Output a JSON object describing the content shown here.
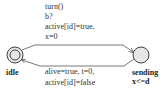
{
  "automaton": {
    "locations": [
      {
        "id": "idle",
        "name": "idle",
        "initial": true,
        "invariant": ""
      },
      {
        "id": "sending",
        "name": "sending",
        "initial": false,
        "invariant": "x<=d"
      }
    ],
    "edges": [
      {
        "from": "idle",
        "to": "sending",
        "labels": [
          "turn()",
          "b?",
          "active[id]=true,",
          "x=0"
        ]
      },
      {
        "from": "sending",
        "to": "idle",
        "labels": [
          "alive=true, t=0,",
          "active[id]=false"
        ]
      }
    ]
  },
  "colors": {
    "location_fill": "#e6e6e6",
    "stroke": "#444444"
  }
}
